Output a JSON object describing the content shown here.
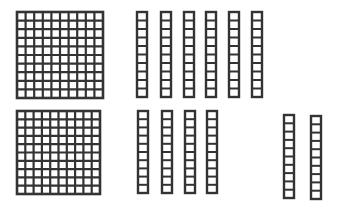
{
  "diagram": {
    "type": "base-ten-blocks",
    "stroke_color": "#333333",
    "fill_color": "#ffffff",
    "rows": [
      {
        "name": "top-row",
        "hundreds": [
          {
            "x": 17,
            "y": 12,
            "size": 86
          }
        ],
        "tens": [
          {
            "x": 137,
            "y": 12,
            "w": 10,
            "h": 85
          },
          {
            "x": 161,
            "y": 12,
            "w": 10,
            "h": 85
          },
          {
            "x": 184,
            "y": 12,
            "w": 10,
            "h": 85
          },
          {
            "x": 206,
            "y": 12,
            "w": 10,
            "h": 85
          },
          {
            "x": 229,
            "y": 12,
            "w": 10,
            "h": 85
          },
          {
            "x": 252,
            "y": 12,
            "w": 10,
            "h": 85
          }
        ]
      },
      {
        "name": "bottom-row",
        "hundreds": [
          {
            "x": 17,
            "y": 111,
            "size": 83
          }
        ],
        "tens": [
          {
            "x": 138,
            "y": 111,
            "w": 10,
            "h": 82
          },
          {
            "x": 162,
            "y": 111,
            "w": 10,
            "h": 82
          },
          {
            "x": 185,
            "y": 111,
            "w": 10,
            "h": 82
          },
          {
            "x": 207,
            "y": 111,
            "w": 10,
            "h": 82
          },
          {
            "x": 284,
            "y": 115,
            "w": 10,
            "h": 83
          },
          {
            "x": 311,
            "y": 116,
            "w": 10,
            "h": 83
          }
        ]
      }
    ],
    "grid_cells_per_side": 10,
    "rod_cells": 10
  }
}
